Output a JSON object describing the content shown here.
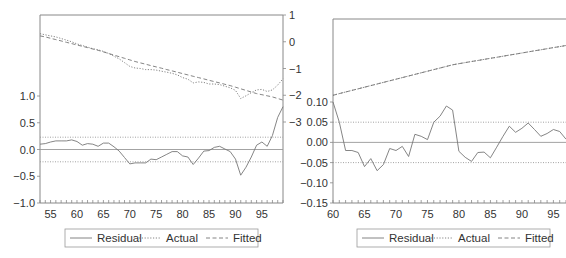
{
  "chart_data": [
    {
      "type": "line",
      "title": "",
      "xlabel": "",
      "ylabel": "",
      "x_range": [
        1953,
        1999
      ],
      "x_ticks": [
        "55",
        "60",
        "65",
        "70",
        "75",
        "80",
        "85",
        "90",
        "95"
      ],
      "x_tick_values": [
        1955,
        1960,
        1965,
        1970,
        1975,
        1980,
        1985,
        1990,
        1995
      ],
      "left_axis": {
        "label": "Residual",
        "ylim": [
          -1.0,
          1.0
        ],
        "ticks": [
          "1.0",
          "0.5",
          "0.0",
          "-0.5",
          "-1.0"
        ],
        "tick_values": [
          1.0,
          0.5,
          0.0,
          -0.5,
          -1.0
        ]
      },
      "right_axis": {
        "label": "Actual / Fitted",
        "ylim": [
          -3,
          1
        ],
        "ticks": [
          "1",
          "0",
          "-1",
          "-2",
          "-3"
        ],
        "tick_values": [
          1,
          0,
          -1,
          -2,
          -3
        ]
      },
      "reference_lines": {
        "zero": 0.0,
        "band_upper": 0.23,
        "band_lower": -0.23
      },
      "x": [
        1953,
        1954,
        1955,
        1956,
        1957,
        1958,
        1959,
        1960,
        1961,
        1962,
        1963,
        1964,
        1965,
        1966,
        1967,
        1968,
        1969,
        1970,
        1971,
        1972,
        1973,
        1974,
        1975,
        1976,
        1977,
        1978,
        1979,
        1980,
        1981,
        1982,
        1983,
        1984,
        1985,
        1986,
        1987,
        1988,
        1989,
        1990,
        1991,
        1992,
        1993,
        1994,
        1995,
        1996,
        1997,
        1998,
        1999
      ],
      "series": [
        {
          "name": "Residual",
          "axis": "left",
          "style": "solid",
          "values": [
            0.1,
            0.11,
            0.14,
            0.16,
            0.16,
            0.16,
            0.18,
            0.15,
            0.08,
            0.11,
            0.1,
            0.06,
            0.12,
            0.12,
            0.05,
            -0.03,
            -0.15,
            -0.27,
            -0.25,
            -0.25,
            -0.25,
            -0.18,
            -0.19,
            -0.14,
            -0.09,
            -0.04,
            -0.04,
            -0.12,
            -0.14,
            -0.28,
            -0.16,
            -0.03,
            -0.02,
            0.04,
            0.06,
            0.01,
            -0.04,
            -0.18,
            -0.48,
            -0.33,
            -0.14,
            0.08,
            0.14,
            0.06,
            0.26,
            0.6,
            0.8
          ]
        },
        {
          "name": "Actual",
          "axis": "right",
          "style": "dotted",
          "values": [
            0.3,
            0.26,
            0.22,
            0.18,
            0.12,
            0.06,
            0.0,
            -0.08,
            -0.14,
            -0.2,
            -0.26,
            -0.3,
            -0.36,
            -0.44,
            -0.54,
            -0.64,
            -0.78,
            -0.92,
            -0.98,
            -1.0,
            -1.04,
            -1.04,
            -1.06,
            -1.1,
            -1.14,
            -1.18,
            -1.24,
            -1.34,
            -1.4,
            -1.54,
            -1.5,
            -1.52,
            -1.58,
            -1.58,
            -1.6,
            -1.66,
            -1.72,
            -1.82,
            -2.12,
            -2.02,
            -1.9,
            -1.8,
            -1.78,
            -1.86,
            -1.8,
            -1.62,
            -1.38
          ]
        },
        {
          "name": "Fitted",
          "axis": "right",
          "style": "dashed",
          "values": [
            0.22,
            0.18,
            0.13,
            0.08,
            0.03,
            -0.02,
            -0.07,
            -0.12,
            -0.17,
            -0.22,
            -0.27,
            -0.32,
            -0.38,
            -0.44,
            -0.5,
            -0.56,
            -0.62,
            -0.68,
            -0.74,
            -0.79,
            -0.84,
            -0.89,
            -0.94,
            -0.99,
            -1.04,
            -1.09,
            -1.14,
            -1.19,
            -1.24,
            -1.29,
            -1.34,
            -1.39,
            -1.44,
            -1.49,
            -1.54,
            -1.59,
            -1.64,
            -1.7,
            -1.76,
            -1.82,
            -1.88,
            -1.94,
            -1.98,
            -2.02,
            -2.06,
            -2.12,
            -2.18
          ]
        }
      ],
      "legend": {
        "position": "bottom",
        "entries": [
          "Residual",
          "Actual",
          "Fitted"
        ]
      },
      "grid": false
    },
    {
      "type": "line",
      "title": "",
      "xlabel": "",
      "ylabel": "",
      "x_range": [
        1960,
        1997
      ],
      "x_ticks": [
        "60",
        "65",
        "70",
        "75",
        "80",
        "85",
        "90",
        "95"
      ],
      "x_tick_values": [
        1960,
        1965,
        1970,
        1975,
        1980,
        1985,
        1990,
        1995
      ],
      "left_axis": {
        "label": "Residual",
        "ylim": [
          -0.15,
          0.1
        ],
        "ticks": [
          "0.10",
          "0.05",
          "0.00",
          "-0.05",
          "-0.10",
          "-0.15"
        ],
        "tick_values": [
          0.1,
          0.05,
          0.0,
          -0.05,
          -0.1,
          -0.15
        ]
      },
      "reference_lines": {
        "zero": 0.0,
        "band_upper": 0.05,
        "band_lower": -0.05
      },
      "x": [
        1960,
        1961,
        1962,
        1963,
        1964,
        1965,
        1966,
        1967,
        1968,
        1969,
        1970,
        1971,
        1972,
        1973,
        1974,
        1975,
        1976,
        1977,
        1978,
        1979,
        1980,
        1981,
        1982,
        1983,
        1984,
        1985,
        1986,
        1987,
        1988,
        1989,
        1990,
        1991,
        1992,
        1993,
        1994,
        1995,
        1996,
        1997
      ],
      "series": [
        {
          "name": "Residual",
          "axis": "left",
          "style": "solid",
          "values": [
            0.1,
            0.05,
            -0.02,
            -0.02,
            -0.025,
            -0.06,
            -0.04,
            -0.07,
            -0.055,
            -0.015,
            -0.02,
            -0.01,
            -0.035,
            0.02,
            0.015,
            0.007,
            0.05,
            0.065,
            0.09,
            0.08,
            -0.022,
            -0.037,
            -0.047,
            -0.025,
            -0.024,
            -0.038,
            -0.012,
            0.015,
            0.04,
            0.025,
            0.035,
            0.048,
            0.032,
            0.015,
            0.022,
            0.032,
            0.027,
            0.008
          ]
        },
        {
          "name": "Actual",
          "axis": "right",
          "style": "dotted",
          "values": [
            -2.0,
            -1.94,
            -1.88,
            -1.82,
            -1.76,
            -1.7,
            -1.64,
            -1.58,
            -1.52,
            -1.46,
            -1.4,
            -1.34,
            -1.28,
            -1.22,
            -1.16,
            -1.1,
            -1.04,
            -0.98,
            -0.92,
            -0.86,
            -0.82,
            -0.78,
            -0.74,
            -0.7,
            -0.66,
            -0.62,
            -0.58,
            -0.54,
            -0.5,
            -0.46,
            -0.42,
            -0.38,
            -0.34,
            -0.3,
            -0.26,
            -0.22,
            -0.18,
            -0.14
          ]
        },
        {
          "name": "Fitted",
          "axis": "right",
          "style": "dashed",
          "values": [
            -2.0,
            -1.94,
            -1.88,
            -1.82,
            -1.76,
            -1.7,
            -1.64,
            -1.58,
            -1.52,
            -1.46,
            -1.4,
            -1.34,
            -1.28,
            -1.22,
            -1.16,
            -1.1,
            -1.04,
            -0.98,
            -0.92,
            -0.86,
            -0.82,
            -0.78,
            -0.74,
            -0.7,
            -0.66,
            -0.62,
            -0.58,
            -0.54,
            -0.5,
            -0.46,
            -0.42,
            -0.38,
            -0.34,
            -0.3,
            -0.26,
            -0.22,
            -0.18,
            -0.14
          ]
        }
      ],
      "legend": {
        "position": "bottom",
        "entries": [
          "Residual",
          "Actual",
          "Fitted"
        ]
      },
      "grid": false
    }
  ],
  "colors": {
    "line": "#777777",
    "axis": "#888888",
    "text": "#333333",
    "band": "#999999"
  }
}
